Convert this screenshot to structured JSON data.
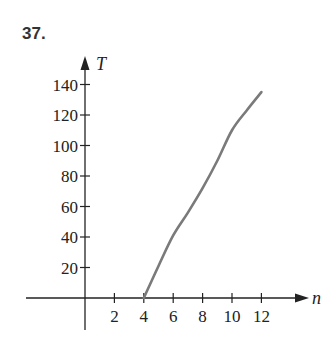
{
  "problem": {
    "number": "37."
  },
  "chart_data": {
    "type": "line",
    "title": "",
    "xlabel": "n",
    "ylabel": "T",
    "xlim": [
      0,
      13
    ],
    "ylim": [
      0,
      150
    ],
    "x_ticks": [
      2,
      4,
      6,
      8,
      10,
      12
    ],
    "y_ticks": [
      20,
      40,
      60,
      80,
      100,
      120,
      140
    ],
    "grid": false,
    "legend": null,
    "series": [
      {
        "name": "T(n)",
        "color": "#7a7a7a",
        "x": [
          4,
          5,
          6,
          7,
          8,
          9,
          10,
          11,
          12
        ],
        "y": [
          0,
          21,
          41,
          56,
          72,
          90,
          110,
          123,
          135
        ]
      }
    ]
  },
  "labels": {
    "x_axis": "n",
    "y_axis": "T",
    "x_ticks": [
      "2",
      "4",
      "6",
      "8",
      "10",
      "12"
    ],
    "y_ticks": [
      "20",
      "40",
      "60",
      "80",
      "100",
      "120",
      "140"
    ]
  }
}
